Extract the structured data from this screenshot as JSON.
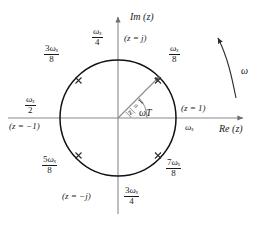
{
  "figure": {
    "type": "z-plane unit circle diagram",
    "axes": {
      "imaginary_label": "Im (z)",
      "real_label": "Re (z)",
      "origin_px": [
        118,
        118
      ],
      "radius_px": 58
    },
    "circle": {
      "radius_label_num": "|z|",
      "radius_label_eq": " = 1",
      "stroke": "#111111"
    },
    "angle_label": "ωT",
    "rotation_arrow_label": "ω",
    "colors": {
      "ink": "#1a1a1a",
      "axis": "#8a8a8a",
      "circle": "#111111",
      "vector": "#8a8a8a",
      "background": "#ffffff"
    },
    "markers": [
      {
        "name": "omega-s-over-8",
        "angle_deg": 45,
        "frac_num": "ω",
        "frac_num_sub": "s",
        "frac_num_coef": "",
        "frac_den": "8",
        "tick": true
      },
      {
        "name": "three-omega-s-over-8",
        "angle_deg": 135,
        "frac_num": "ω",
        "frac_num_sub": "s",
        "frac_num_coef": "3",
        "frac_den": "8",
        "tick": true
      },
      {
        "name": "five-omega-s-over-8",
        "angle_deg": 225,
        "frac_num": "ω",
        "frac_num_sub": "s",
        "frac_num_coef": "5",
        "frac_den": "8",
        "tick": true
      },
      {
        "name": "seven-omega-s-over-8",
        "angle_deg": 315,
        "frac_num": "ω",
        "frac_num_sub": "s",
        "frac_num_coef": "7",
        "frac_den": "8",
        "tick": true
      },
      {
        "name": "omega-s-over-4",
        "angle_deg": 90,
        "frac_num": "ω",
        "frac_num_sub": "s",
        "frac_num_coef": "",
        "frac_den": "4",
        "tick": false
      },
      {
        "name": "omega-s-over-2",
        "angle_deg": 180,
        "frac_num": "ω",
        "frac_num_sub": "s",
        "frac_num_coef": "",
        "frac_den": "2",
        "tick": false
      },
      {
        "name": "three-omega-s-over-4",
        "angle_deg": 270,
        "frac_num": "ω",
        "frac_num_sub": "s",
        "frac_num_coef": "3",
        "frac_den": "4",
        "tick": false
      }
    ],
    "labels": {
      "top_fraction_coef": "",
      "top_fraction_num": "ω",
      "top_fraction_sub": "s",
      "top_fraction_den": "4",
      "top_point": "(z = j)",
      "upper_right_coef": "",
      "upper_right_num": "ω",
      "upper_right_sub": "s",
      "upper_right_den": "8",
      "upper_left_coef": "3",
      "upper_left_num": "ω",
      "upper_left_sub": "s",
      "upper_left_den": "8",
      "left_fraction_coef": "",
      "left_fraction_num": "ω",
      "left_fraction_sub": "s",
      "left_fraction_den": "2",
      "left_point": "(z = −1)",
      "right_point": "(z = 1)",
      "right_omega_s": "ω",
      "right_omega_s_sub": "s",
      "lower_left_coef": "5",
      "lower_left_num": "ω",
      "lower_left_sub": "s",
      "lower_left_den": "8",
      "lower_right_coef": "7",
      "lower_right_num": "ω",
      "lower_right_sub": "s",
      "lower_right_den": "8",
      "bottom_point": "(z = −j)",
      "bottom_fraction_coef": "3",
      "bottom_fraction_num": "ω",
      "bottom_fraction_sub": "s",
      "bottom_fraction_den": "4",
      "radius_text_a": "|z|",
      "radius_text_b": " = 1",
      "angle_text": "ωT",
      "omega_arrow_text": "ω",
      "im_axis_text": "Im (z)",
      "re_axis_text": "Re (z)"
    }
  }
}
